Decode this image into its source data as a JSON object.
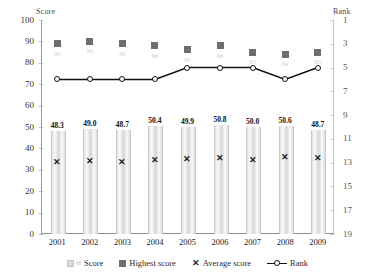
{
  "chart_data": {
    "type": "bar",
    "title": "",
    "xlabel": "",
    "ylabel": "Score",
    "y2label": "Rank",
    "categories": [
      "2001",
      "2002",
      "2003",
      "2004",
      "2005",
      "2006",
      "2007",
      "2008",
      "2009"
    ],
    "ylim": [
      0,
      100
    ],
    "yticks": [
      100,
      90,
      80,
      70,
      60,
      50,
      40,
      30,
      20,
      10,
      0
    ],
    "y2lim": [
      1,
      19
    ],
    "y2ticks": [
      1,
      3,
      5,
      7,
      9,
      11,
      13,
      15,
      17,
      19
    ],
    "y2_inverted": true,
    "grid": false,
    "legend_position": "bottom",
    "series": [
      {
        "name": "Score",
        "type": "bar",
        "axis": "left",
        "values": [
          48.3,
          49.0,
          48.7,
          50.4,
          49.9,
          50.8,
          50.0,
          50.6,
          48.7
        ],
        "labels": [
          "48.3",
          "49.0",
          "48.7",
          "50.4",
          "49.9",
          "50.8",
          "50.0",
          "50.6",
          "48.7"
        ],
        "color": "#dcdcdc"
      },
      {
        "name": "Highest score",
        "type": "scatter",
        "axis": "left",
        "values": [
          89,
          90,
          89,
          88,
          86,
          88,
          85,
          84,
          85
        ],
        "color": "#6e6e6e"
      },
      {
        "name": "Average score",
        "type": "scatter",
        "axis": "left",
        "values": [
          33.5,
          34.0,
          33.5,
          34.5,
          35.0,
          35.5,
          34.5,
          36.0,
          35.5
        ],
        "color": "#1d1d1d"
      },
      {
        "name": "Rank",
        "type": "line",
        "axis": "right",
        "values": [
          6,
          6,
          6,
          6,
          5,
          5,
          5,
          6,
          5
        ],
        "color": "#111111"
      }
    ]
  },
  "legend": {
    "items": [
      {
        "label": "Score",
        "marker": "bar-swatch"
      },
      {
        "label": "Highest score",
        "marker": "square-marker"
      },
      {
        "label": "Average score",
        "marker": "x-marker"
      },
      {
        "label": "Rank",
        "marker": "line-marker"
      }
    ]
  }
}
